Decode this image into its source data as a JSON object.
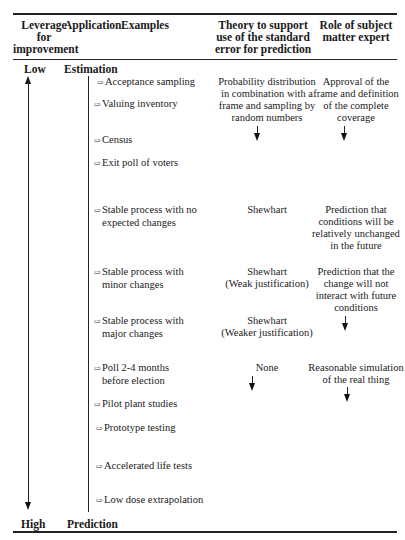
{
  "header": {
    "col1": [
      "Leverage",
      "for",
      "improvement"
    ],
    "col2": "Application",
    "col3": "Examples",
    "col4": [
      "Theory to support",
      "use of the standard",
      "error for prediction"
    ],
    "col5": [
      "Role of subject",
      "matter expert"
    ]
  },
  "leverage": {
    "low": "Low",
    "high": "High"
  },
  "application": {
    "top": "Estimation",
    "bottom": "Prediction"
  },
  "icons": {
    "example_bullet": "hollow-right-arrow-icon"
  },
  "examples": [
    {
      "line1": "Acceptance sampling",
      "line2": ""
    },
    {
      "line1": "Valuing inventory",
      "line2": ""
    },
    {
      "line1": "Census",
      "line2": ""
    },
    {
      "line1": "Exit poll of voters",
      "line2": ""
    },
    {
      "line1": "Stable process with no",
      "line2": "expected changes"
    },
    {
      "line1": "Stable process with",
      "line2": "minor changes"
    },
    {
      "line1": "Stable process with",
      "line2": "major changes"
    },
    {
      "line1": "Poll 2-4 months",
      "line2": "before election"
    },
    {
      "line1": "Pilot plant studies",
      "line2": ""
    },
    {
      "line1": "Prototype testing",
      "line2": ""
    },
    {
      "line1": "Accelerated life tests",
      "line2": ""
    },
    {
      "line1": "Low dose extrapolation",
      "line2": ""
    }
  ],
  "theory": [
    {
      "lines": [
        "Probability distribution",
        "in combination with a",
        "frame and sampling by",
        "random numbers"
      ]
    },
    {
      "lines": [
        "Shewhart"
      ]
    },
    {
      "lines": [
        "Shewhart",
        "(Weak justification)"
      ]
    },
    {
      "lines": [
        "Shewhart",
        "(Weaker justification)"
      ]
    },
    {
      "lines": [
        "None"
      ]
    }
  ],
  "expert": [
    {
      "lines": [
        "Approval of the",
        "frame and definition",
        "of the complete",
        "coverage"
      ]
    },
    {
      "lines": [
        "Prediction that",
        "conditions will be",
        "relatively unchanged",
        "in the future"
      ]
    },
    {
      "lines": [
        "Prediction that the",
        "change will not",
        "interact with future",
        "conditions"
      ]
    },
    {
      "lines": [
        "Reasonable simulation",
        "of the real thing"
      ]
    }
  ]
}
